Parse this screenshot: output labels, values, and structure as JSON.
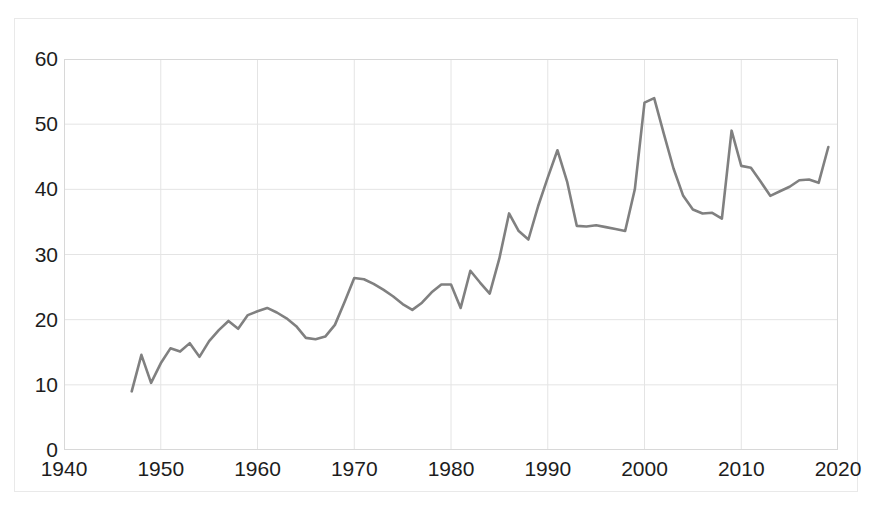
{
  "chart_data": {
    "type": "line",
    "title": "",
    "subtitle": "",
    "xlabel": "",
    "ylabel": "",
    "xlim": [
      1940,
      2020
    ],
    "ylim": [
      0,
      60
    ],
    "xticks": [
      1940,
      1950,
      1960,
      1970,
      1980,
      1990,
      2000,
      2010,
      2020
    ],
    "yticks": [
      0,
      10,
      20,
      30,
      40,
      50,
      60
    ],
    "grid": true,
    "legend": null,
    "legend_position": "none",
    "annotations": [],
    "series": [
      {
        "name": "series-1",
        "color": "#808080",
        "x": [
          1947,
          1948,
          1949,
          1950,
          1951,
          1952,
          1953,
          1954,
          1955,
          1956,
          1957,
          1958,
          1959,
          1960,
          1961,
          1962,
          1963,
          1964,
          1965,
          1966,
          1967,
          1968,
          1969,
          1970,
          1971,
          1972,
          1973,
          1974,
          1975,
          1976,
          1977,
          1978,
          1979,
          1980,
          1981,
          1982,
          1983,
          1984,
          1985,
          1986,
          1987,
          1988,
          1989,
          1990,
          1991,
          1992,
          1993,
          1994,
          1995,
          1996,
          1997,
          1998,
          1999,
          2000,
          2001,
          2002,
          2003,
          2004,
          2005,
          2006,
          2007,
          2008,
          2009,
          2010,
          2011,
          2012,
          2013,
          2014,
          2015,
          2016,
          2017,
          2018,
          2019
        ],
        "values": [
          9.0,
          14.6,
          10.3,
          13.3,
          15.6,
          15.1,
          16.4,
          14.3,
          16.7,
          18.4,
          19.8,
          18.6,
          20.7,
          21.3,
          21.8,
          21.1,
          20.2,
          19.0,
          17.2,
          17.0,
          17.4,
          19.2,
          22.7,
          26.4,
          26.2,
          25.5,
          24.6,
          23.6,
          22.4,
          21.5,
          22.6,
          24.2,
          25.4,
          25.4,
          21.8,
          27.5,
          25.7,
          24.0,
          29.4,
          36.3,
          33.6,
          32.3,
          37.4,
          41.8,
          46.0,
          41.2,
          34.4,
          34.3,
          34.5,
          34.2,
          33.9,
          33.6,
          40.0,
          53.3,
          54.0,
          48.5,
          43.2,
          39.0,
          36.9,
          36.3,
          36.4,
          35.5,
          49.0,
          43.6,
          43.3,
          41.2,
          39.0,
          39.7,
          40.4,
          41.4,
          41.5,
          41.0,
          46.5
        ]
      }
    ]
  },
  "axes": {
    "y_tick_labels": [
      "60",
      "50",
      "40",
      "30",
      "20",
      "10",
      "0"
    ],
    "x_tick_labels": [
      "1940",
      "1950",
      "1960",
      "1970",
      "1980",
      "1990",
      "2000",
      "2010",
      "2020"
    ]
  },
  "style": {
    "line_color": "#808080",
    "grid_color": "#e4e4e4",
    "axis_color": "#d8d8d8",
    "text_color": "#1d1d1d",
    "background": "#ffffff"
  }
}
